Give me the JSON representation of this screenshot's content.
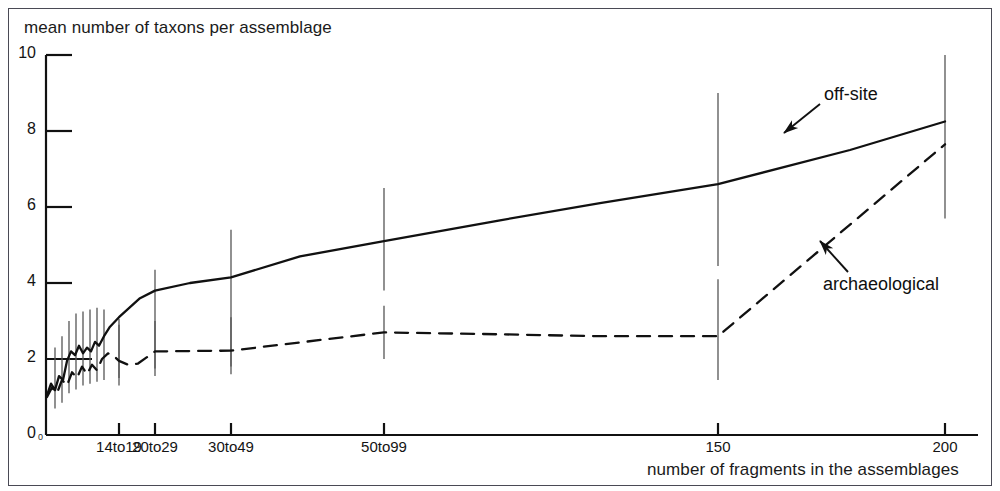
{
  "figure": {
    "background_color": "#ffffff",
    "line_color": "#111111",
    "errorbar_color": "#555555",
    "border_color": "#4a4a55"
  },
  "chart_data": {
    "type": "line",
    "title": "",
    "subtitle": "",
    "ylabel": "mean number of taxons per assemblage",
    "xlabel": "number of fragments in the assemblages",
    "grid": false,
    "legend_position": "inline-annotations",
    "ylim": [
      0,
      10
    ],
    "y_ticks": [
      0,
      2,
      4,
      6,
      8,
      10
    ],
    "y_tick_labels": [
      "0",
      "2",
      "4",
      "6",
      "8",
      "10"
    ],
    "x_tick_labels": [
      "14to19",
      "20to29",
      "30to49",
      "50to99",
      "150",
      "200"
    ],
    "x_tick_positions_px": [
      119,
      155,
      231,
      384,
      718,
      945
    ],
    "x_origin_label": "0",
    "xlim_px": [
      46,
      978
    ],
    "annotations": [
      {
        "text": "off-site",
        "target_series": "off-site",
        "arrow_from_px": [
          820,
          104
        ],
        "arrow_to_px": [
          784,
          133
        ]
      },
      {
        "text": "archaeological",
        "target_series": "archaeological",
        "arrow_from_px": [
          848,
          272
        ],
        "arrow_to_px": [
          820,
          241
        ]
      }
    ],
    "series": [
      {
        "name": "off-site",
        "style": "solid",
        "points": [
          {
            "x_px": 47,
            "y": 1.05
          },
          {
            "x_px": 51,
            "y": 1.35
          },
          {
            "x_px": 55,
            "y": 1.18
          },
          {
            "x_px": 59,
            "y": 1.55
          },
          {
            "x_px": 63,
            "y": 1.45
          },
          {
            "x_px": 67,
            "y": 1.95
          },
          {
            "x_px": 71,
            "y": 2.2
          },
          {
            "x_px": 75,
            "y": 2.1
          },
          {
            "x_px": 79,
            "y": 2.35
          },
          {
            "x_px": 83,
            "y": 2.15
          },
          {
            "x_px": 87,
            "y": 2.3
          },
          {
            "x_px": 91,
            "y": 2.2
          },
          {
            "x_px": 95,
            "y": 2.45
          },
          {
            "x_px": 99,
            "y": 2.35
          },
          {
            "x_px": 104,
            "y": 2.6
          },
          {
            "x_px": 110,
            "y": 2.85
          },
          {
            "x_px": 119,
            "y": 3.1
          },
          {
            "x_px": 140,
            "y": 3.6
          },
          {
            "x_px": 155,
            "y": 3.8
          },
          {
            "x_px": 190,
            "y": 4.0
          },
          {
            "x_px": 231,
            "y": 4.15
          },
          {
            "x_px": 300,
            "y": 4.7
          },
          {
            "x_px": 384,
            "y": 5.1
          },
          {
            "x_px": 500,
            "y": 5.65
          },
          {
            "x_px": 600,
            "y": 6.1
          },
          {
            "x_px": 718,
            "y": 6.6
          },
          {
            "x_px": 850,
            "y": 7.5
          },
          {
            "x_px": 945,
            "y": 8.25
          }
        ],
        "error_bars": [
          {
            "x_px": 55,
            "low": 0.7,
            "high": 2.3
          },
          {
            "x_px": 62,
            "low": 0.85,
            "high": 2.6
          },
          {
            "x_px": 69,
            "low": 1.1,
            "high": 3.0
          },
          {
            "x_px": 76,
            "low": 1.2,
            "high": 3.2
          },
          {
            "x_px": 83,
            "low": 1.3,
            "high": 3.25
          },
          {
            "x_px": 90,
            "low": 1.35,
            "high": 3.3
          },
          {
            "x_px": 97,
            "low": 1.4,
            "high": 3.35
          },
          {
            "x_px": 104,
            "low": 1.45,
            "high": 3.3
          },
          {
            "x_px": 119,
            "low": 1.5,
            "high": 3.05
          },
          {
            "x_px": 155,
            "low": 1.75,
            "high": 4.35
          },
          {
            "x_px": 231,
            "low": 1.8,
            "high": 5.4
          },
          {
            "x_px": 384,
            "low": 3.8,
            "high": 6.5
          },
          {
            "x_px": 718,
            "low": 4.45,
            "high": 9.0
          },
          {
            "x_px": 945,
            "low": 5.7,
            "high": 10.0
          }
        ]
      },
      {
        "name": "archaeological",
        "style": "dashed",
        "points": [
          {
            "x_px": 47,
            "y": 1.0
          },
          {
            "x_px": 52,
            "y": 1.25
          },
          {
            "x_px": 57,
            "y": 1.1
          },
          {
            "x_px": 62,
            "y": 1.45
          },
          {
            "x_px": 67,
            "y": 1.3
          },
          {
            "x_px": 72,
            "y": 1.65
          },
          {
            "x_px": 77,
            "y": 1.5
          },
          {
            "x_px": 82,
            "y": 1.8
          },
          {
            "x_px": 87,
            "y": 1.6
          },
          {
            "x_px": 92,
            "y": 1.85
          },
          {
            "x_px": 97,
            "y": 1.7
          },
          {
            "x_px": 102,
            "y": 2.0
          },
          {
            "x_px": 108,
            "y": 2.15
          },
          {
            "x_px": 113,
            "y": 2.1
          },
          {
            "x_px": 119,
            "y": 1.95
          },
          {
            "x_px": 128,
            "y": 1.85
          },
          {
            "x_px": 138,
            "y": 1.88
          },
          {
            "x_px": 155,
            "y": 2.2
          },
          {
            "x_px": 231,
            "y": 2.22
          },
          {
            "x_px": 384,
            "y": 2.7
          },
          {
            "x_px": 500,
            "y": 2.65
          },
          {
            "x_px": 600,
            "y": 2.6
          },
          {
            "x_px": 718,
            "y": 2.6
          },
          {
            "x_px": 945,
            "y": 7.65
          }
        ],
        "error_bars": [
          {
            "x_px": 119,
            "low": 1.3,
            "high": 2.9
          },
          {
            "x_px": 155,
            "low": 1.55,
            "high": 3.0
          },
          {
            "x_px": 231,
            "low": 1.6,
            "high": 3.1
          },
          {
            "x_px": 384,
            "low": 2.0,
            "high": 3.4
          },
          {
            "x_px": 718,
            "low": 1.45,
            "high": 4.1
          }
        ]
      }
    ]
  }
}
